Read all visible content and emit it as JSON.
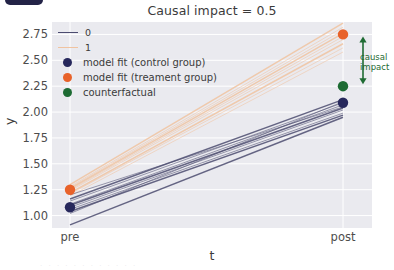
{
  "figure": {
    "title": "Causal impact = 0.5",
    "badge": "clipped-badge"
  },
  "annotation": {
    "line1": "causal",
    "line2": "impact",
    "color": "#1f6b33"
  },
  "legend": {
    "entries": [
      {
        "label": "0",
        "type": "line",
        "color": "#4c4c70"
      },
      {
        "label": "1",
        "type": "line",
        "color": "#f0c3a0"
      },
      {
        "label": "model fit (control group)",
        "type": "dot",
        "color": "#27285c"
      },
      {
        "label": "model fit (treament group)",
        "type": "dot",
        "color": "#e8622a"
      },
      {
        "label": "counterfactual",
        "type": "dot",
        "color": "#1d6b33"
      }
    ]
  },
  "footer": {
    "clipped_text": "·  ·   ·  ·    ·  ·  ·  ·   ·  ·  ·  ·"
  },
  "chart_data": {
    "type": "line",
    "title": "Causal impact = 0.5",
    "xlabel": "t",
    "ylabel": "y",
    "x": [
      "pre",
      "post"
    ],
    "xticklabels": [
      "pre",
      "post"
    ],
    "yticklabels": [
      "1.00",
      "1.25",
      "1.50",
      "1.75",
      "2.00",
      "2.25",
      "2.50",
      "2.75"
    ],
    "ylim": [
      0.88,
      2.87
    ],
    "grid": true,
    "legend_position": "upper left",
    "colors": {
      "group0_line": "#4c4c70",
      "group1_line": "#f0c3a0",
      "control_dot": "#27285c",
      "treatment_dot": "#e8622a",
      "counterfactual_dot": "#1d6b33",
      "panel": "#eaeaef",
      "gridline": "#ffffff"
    },
    "points": [
      {
        "name": "model fit (control group)",
        "x": "pre",
        "y": 1.08,
        "color": "#27285c"
      },
      {
        "name": "model fit (treament group)",
        "x": "pre",
        "y": 1.25,
        "color": "#e8622a"
      },
      {
        "name": "model fit (control group)",
        "x": "post",
        "y": 2.09,
        "color": "#27285c"
      },
      {
        "name": "model fit (treament group)",
        "x": "post",
        "y": 2.75,
        "color": "#e8622a"
      },
      {
        "name": "counterfactual",
        "x": "post",
        "y": 2.25,
        "color": "#1d6b33"
      }
    ],
    "causal_impact": {
      "value": 0.5,
      "from": 2.25,
      "to": 2.75
    },
    "series": [
      {
        "name": "0",
        "group": "control",
        "color": "#4c4c70",
        "posterior_samples": [
          {
            "pre": 1.16,
            "post": 2.12
          },
          {
            "pre": 1.14,
            "post": 2.09
          },
          {
            "pre": 1.11,
            "post": 2.07
          },
          {
            "pre": 1.1,
            "post": 2.04
          },
          {
            "pre": 1.08,
            "post": 2.02
          },
          {
            "pre": 1.06,
            "post": 1.99
          },
          {
            "pre": 1.04,
            "post": 1.97
          },
          {
            "pre": 1.2,
            "post": 2.05
          },
          {
            "pre": 1.02,
            "post": 2.1
          },
          {
            "pre": 0.91,
            "post": 1.95
          }
        ]
      },
      {
        "name": "1",
        "group": "treatment",
        "color": "#f0c3a0",
        "posterior_samples": [
          {
            "pre": 1.3,
            "post": 2.86
          },
          {
            "pre": 1.28,
            "post": 2.82
          },
          {
            "pre": 1.27,
            "post": 2.79
          },
          {
            "pre": 1.26,
            "post": 2.76
          },
          {
            "pre": 1.25,
            "post": 2.73
          },
          {
            "pre": 1.24,
            "post": 2.7
          },
          {
            "pre": 1.22,
            "post": 2.66
          },
          {
            "pre": 1.21,
            "post": 2.62
          },
          {
            "pre": 1.19,
            "post": 2.58
          }
        ]
      }
    ]
  }
}
